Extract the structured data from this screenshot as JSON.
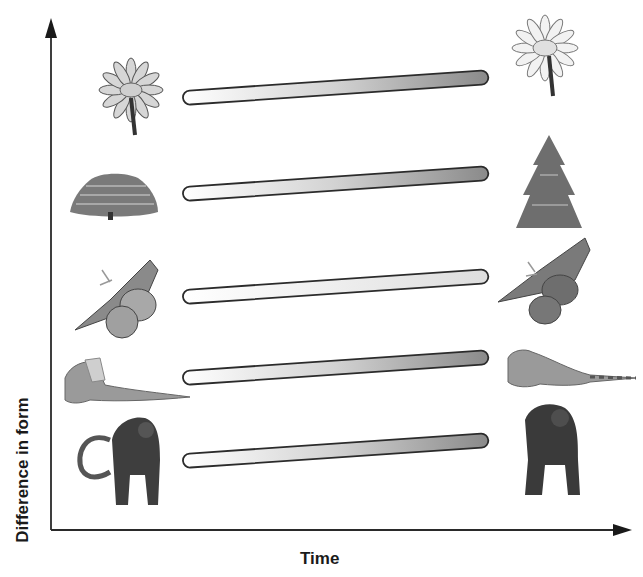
{
  "diagram": {
    "type": "evolution-rate-comparison",
    "y_axis_label": "Difference in form",
    "x_axis_label": "Time",
    "colors": {
      "axis": "#2a2a2a",
      "bar_outline": "#2b2b2b",
      "bar_start": "#ffffff",
      "bar_end_high_change": "#8c8c8c",
      "bar_end_low_change": "#dcdcdc"
    },
    "rows": [
      {
        "organism": "daisy flower",
        "left_icon": "daisy-icon",
        "right_icon": "daisy-icon",
        "change": "high"
      },
      {
        "organism": "tree (shrub to conifer)",
        "left_icon": "broad-tree-icon",
        "right_icon": "conifer-tree-icon",
        "change": "high"
      },
      {
        "organism": "moth",
        "left_icon": "moth-icon",
        "right_icon": "moth-icon",
        "change": "low"
      },
      {
        "organism": "lizard (frilled lizard to iguana)",
        "left_icon": "frilled-lizard-icon",
        "right_icon": "iguana-icon",
        "change": "high"
      },
      {
        "organism": "primate (monkey to ape)",
        "left_icon": "monkey-icon",
        "right_icon": "ape-icon",
        "change": "high"
      }
    ]
  }
}
